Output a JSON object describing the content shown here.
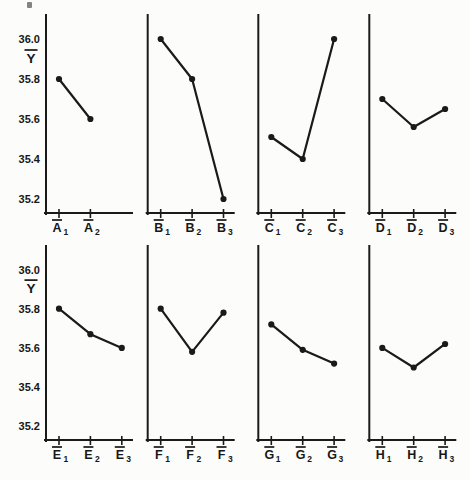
{
  "figure": {
    "kind": "main-effects-plot",
    "title": "",
    "colors": {
      "ink": "#1a1a1a",
      "background": "#fcfcfb"
    }
  },
  "chart_data": {
    "type": "line",
    "title": "",
    "xlabel": "",
    "ylabel": {
      "letter": "Y",
      "overbar": true,
      "display": "Y̅"
    },
    "ylim": [
      35.13,
      36.12
    ],
    "grid": false,
    "legend": null,
    "marker": "filled-circle",
    "yticks": [
      {
        "label": "36.0",
        "value": 36.0
      },
      {
        "label": "35.8",
        "value": 35.8
      },
      {
        "label": "35.6",
        "value": 35.6
      },
      {
        "label": "35.4",
        "value": 35.4
      },
      {
        "label": "35.2",
        "value": 35.2
      }
    ],
    "rows": [
      [
        "A",
        "B",
        "C",
        "D"
      ],
      [
        "E",
        "F",
        "G",
        "H"
      ]
    ],
    "panels": [
      {
        "factor": "A",
        "labels": [
          {
            "letter": "A",
            "sub": "1"
          },
          {
            "letter": "A",
            "sub": "2"
          }
        ],
        "values": [
          35.8,
          35.6
        ]
      },
      {
        "factor": "B",
        "labels": [
          {
            "letter": "B",
            "sub": "1"
          },
          {
            "letter": "B",
            "sub": "2"
          },
          {
            "letter": "B",
            "sub": "3"
          }
        ],
        "values": [
          36.0,
          35.8,
          35.2
        ]
      },
      {
        "factor": "C",
        "labels": [
          {
            "letter": "C",
            "sub": "1"
          },
          {
            "letter": "C",
            "sub": "2"
          },
          {
            "letter": "C",
            "sub": "3"
          }
        ],
        "values": [
          35.51,
          35.4,
          36.0
        ]
      },
      {
        "factor": "D",
        "labels": [
          {
            "letter": "D",
            "sub": "1"
          },
          {
            "letter": "D",
            "sub": "2"
          },
          {
            "letter": "D",
            "sub": "3"
          }
        ],
        "values": [
          35.7,
          35.56,
          35.65
        ]
      },
      {
        "factor": "E",
        "labels": [
          {
            "letter": "E",
            "sub": "1"
          },
          {
            "letter": "E",
            "sub": "2"
          },
          {
            "letter": "E",
            "sub": "3"
          }
        ],
        "values": [
          35.8,
          35.67,
          35.6
        ]
      },
      {
        "factor": "F",
        "labels": [
          {
            "letter": "F",
            "sub": "1"
          },
          {
            "letter": "F",
            "sub": "2"
          },
          {
            "letter": "F",
            "sub": "3"
          }
        ],
        "values": [
          35.8,
          35.58,
          35.78
        ]
      },
      {
        "factor": "G",
        "labels": [
          {
            "letter": "G",
            "sub": "1"
          },
          {
            "letter": "G",
            "sub": "2"
          },
          {
            "letter": "G",
            "sub": "3"
          }
        ],
        "values": [
          35.72,
          35.59,
          35.52
        ]
      },
      {
        "factor": "H",
        "labels": [
          {
            "letter": "H",
            "sub": "1"
          },
          {
            "letter": "H",
            "sub": "2"
          },
          {
            "letter": "H",
            "sub": "3"
          }
        ],
        "values": [
          35.6,
          35.5,
          35.62
        ]
      }
    ]
  }
}
